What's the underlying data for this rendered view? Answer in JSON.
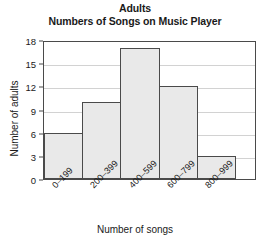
{
  "chart_data": {
    "type": "bar",
    "title": "Adults",
    "subtitle": "Numbers of Songs on Music Player",
    "categories": [
      "0–199",
      "200–399",
      "400–599",
      "600–799",
      "800–999"
    ],
    "values": [
      6,
      10,
      17,
      12,
      3
    ],
    "xlabel": "Number of songs",
    "ylabel": "Number of adults",
    "ylim": [
      0,
      18
    ],
    "yticks": [
      0,
      3,
      6,
      9,
      12,
      15,
      18
    ],
    "grid": true,
    "legend": "none",
    "colors": {
      "bar_fill": "#e9e9e9",
      "bar_border": "#4a4a4a",
      "gridline": "#d2d2d2",
      "text": "#1a1a1a"
    }
  }
}
